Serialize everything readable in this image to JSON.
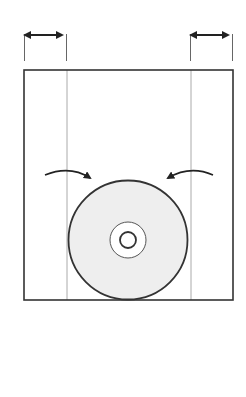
{
  "diagram": {
    "colors": {
      "stroke": "#333333",
      "guide": "#aaaaaa",
      "disc_fill": "#eeeeee",
      "background": "#ffffff"
    },
    "left_margin_dimension": {
      "label": ""
    },
    "right_margin_dimension": {
      "label": ""
    },
    "arrows": [
      {
        "direction": "inward-from-left"
      },
      {
        "direction": "inward-from-right"
      }
    ],
    "disc": {
      "rings": 3
    }
  }
}
